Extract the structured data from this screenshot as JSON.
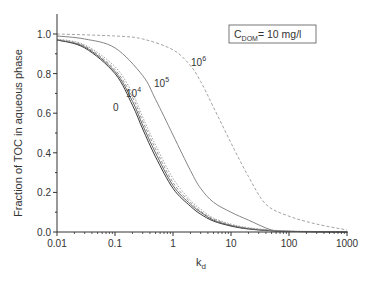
{
  "chart_data": {
    "type": "line",
    "title": "",
    "xlabel": "k_d",
    "xlabel_main": "k",
    "xlabel_sub": "d",
    "ylabel": "Fraction of TOC in aqueous phase",
    "xscale": "log",
    "xlim": [
      0.01,
      1000
    ],
    "ylim": [
      0.0,
      1.0
    ],
    "grid": false,
    "x_ticks": [
      0.01,
      0.1,
      1,
      10,
      100,
      1000
    ],
    "x_tick_labels": [
      "0.01",
      "0.1",
      "1",
      "10",
      "100",
      "1000"
    ],
    "y_ticks": [
      0.0,
      0.2,
      0.4,
      0.6,
      0.8,
      1.0
    ],
    "y_tick_labels": [
      "0.0",
      "0.2",
      "0.4",
      "0.6",
      "0.8",
      "1.0"
    ],
    "annotation": {
      "main": "C",
      "sub": "DOM",
      "rest": "= 10 mg/l"
    },
    "legend_position": "upper right (boxed annotation)",
    "curve_labels": [
      {
        "text": "0",
        "sup": "",
        "x": 113,
        "y": 111
      },
      {
        "text": "10",
        "sup": "4",
        "x": 126,
        "y": 97
      },
      {
        "text": "10",
        "sup": "5",
        "x": 154,
        "y": 87
      },
      {
        "text": "10",
        "sup": "6",
        "x": 191,
        "y": 66
      }
    ],
    "series": [
      {
        "name": "0",
        "style": "solid",
        "color": "#222222",
        "x": [
          0.01,
          0.03,
          0.1,
          0.2,
          0.3,
          0.5,
          1,
          2,
          3,
          5,
          10,
          20,
          50,
          100,
          1000
        ],
        "y": [
          0.97,
          0.93,
          0.8,
          0.64,
          0.52,
          0.38,
          0.22,
          0.13,
          0.09,
          0.055,
          0.03,
          0.015,
          0.006,
          0.003,
          0.0
        ]
      },
      {
        "name": "intermediate-1",
        "style": "solid",
        "color": "#555555",
        "x": [
          0.01,
          0.03,
          0.1,
          0.2,
          0.3,
          0.5,
          1,
          2,
          3,
          5,
          10,
          20,
          50,
          100,
          1000
        ],
        "y": [
          0.97,
          0.935,
          0.81,
          0.66,
          0.54,
          0.4,
          0.235,
          0.14,
          0.1,
          0.06,
          0.033,
          0.017,
          0.007,
          0.003,
          0.0
        ]
      },
      {
        "name": "intermediate-2",
        "style": "dashed",
        "color": "#888888",
        "x": [
          0.01,
          0.03,
          0.1,
          0.2,
          0.3,
          0.5,
          1,
          2,
          3,
          5,
          10,
          20,
          50,
          100,
          1000
        ],
        "y": [
          0.972,
          0.94,
          0.82,
          0.68,
          0.56,
          0.42,
          0.25,
          0.15,
          0.105,
          0.065,
          0.036,
          0.019,
          0.008,
          0.004,
          0.0
        ]
      },
      {
        "name": "10^4",
        "style": "dotted",
        "color": "#999999",
        "x": [
          0.01,
          0.03,
          0.1,
          0.2,
          0.3,
          0.5,
          1,
          2,
          3,
          5,
          10,
          20,
          50,
          100,
          1000
        ],
        "y": [
          0.975,
          0.945,
          0.835,
          0.7,
          0.58,
          0.44,
          0.27,
          0.16,
          0.115,
          0.07,
          0.04,
          0.022,
          0.01,
          0.005,
          0.0
        ]
      },
      {
        "name": "10^5",
        "style": "solid",
        "color": "#777777",
        "x": [
          0.01,
          0.03,
          0.1,
          0.3,
          0.5,
          1,
          2,
          3,
          5,
          10,
          20,
          50,
          100,
          1000
        ],
        "y": [
          0.99,
          0.975,
          0.93,
          0.79,
          0.67,
          0.49,
          0.31,
          0.22,
          0.15,
          0.1,
          0.06,
          0.01,
          0.003,
          0.0
        ]
      },
      {
        "name": "10^6",
        "style": "dashed",
        "color": "#999999",
        "x": [
          0.01,
          0.1,
          0.3,
          1,
          2,
          3,
          5,
          10,
          20,
          40,
          100,
          300,
          1000
        ],
        "y": [
          1.0,
          0.99,
          0.975,
          0.92,
          0.84,
          0.76,
          0.63,
          0.45,
          0.28,
          0.14,
          0.08,
          0.04,
          0.01
        ]
      }
    ]
  }
}
